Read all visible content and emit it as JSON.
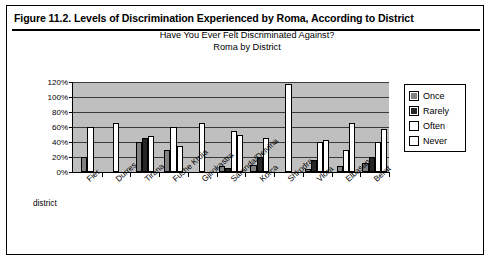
{
  "figure": {
    "caption": "Figure 11.2.  Levels of Discrimination Experienced by Roma, According to District"
  },
  "chart_data": {
    "type": "bar",
    "title": "Have You Ever Felt Discriminated Against?",
    "subtitle": "Roma by District",
    "xlabel": "district",
    "ylabel": "",
    "ylim": [
      0,
      120
    ],
    "ytick_labels": [
      "0%",
      "20%",
      "40%",
      "60%",
      "80%",
      "100%",
      "120%"
    ],
    "ytick_values": [
      0,
      20,
      40,
      60,
      80,
      100,
      120
    ],
    "grid": true,
    "legend_position": "right",
    "categories": [
      "Fier",
      "Durres",
      "Tirana",
      "Fushe Kruja",
      "Gjirokastra",
      "Saranda/Delvina",
      "Korca",
      "Shkodra",
      "Vlora",
      "Elbasan",
      "Berat"
    ],
    "series": [
      {
        "name": "Once",
        "color": "#808080",
        "values": [
          20,
          0,
          40,
          30,
          0,
          8,
          10,
          0,
          4,
          8,
          12
        ]
      },
      {
        "name": "Rarely",
        "color": "#262626",
        "values": [
          0,
          0,
          45,
          0,
          0,
          6,
          20,
          0,
          16,
          0,
          20
        ]
      },
      {
        "name": "Often",
        "color": "#ffffff",
        "values": [
          0,
          0,
          0,
          60,
          0,
          55,
          0,
          0,
          40,
          30,
          40
        ]
      },
      {
        "name": "Never",
        "color": "#ffffff",
        "values": [
          60,
          65,
          48,
          35,
          65,
          50,
          45,
          118,
          43,
          66,
          58
        ]
      }
    ]
  },
  "legend": {
    "items": [
      {
        "label": "Once"
      },
      {
        "label": "Rarely"
      },
      {
        "label": "Often"
      },
      {
        "label": "Never"
      }
    ]
  }
}
